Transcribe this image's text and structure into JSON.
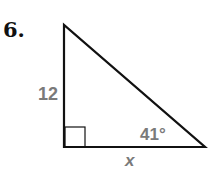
{
  "problem": {
    "number": "6."
  },
  "diagram": {
    "type": "right-triangle",
    "vertical_leg_label": "12",
    "horizontal_leg_label": "x",
    "angle_label": "41°",
    "right_angle_marker": true,
    "label_color": "#7a7a7a",
    "line_color": "#111111"
  }
}
